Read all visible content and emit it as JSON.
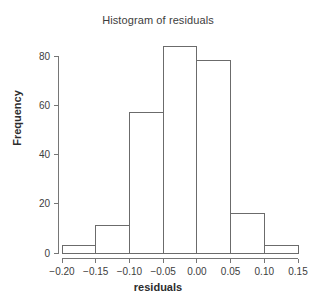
{
  "chart_data": {
    "type": "bar",
    "title": "Histogram of residuals",
    "xlabel": "residuals",
    "ylabel": "Frequency",
    "categories": [
      "-0.20 to -0.15",
      "-0.15 to -0.10",
      "-0.10 to -0.05",
      "-0.05 to 0.00",
      "0.00 to 0.05",
      "0.05 to 0.10",
      "0.10 to 0.15"
    ],
    "bin_edges": [
      -0.2,
      -0.15,
      -0.1,
      -0.05,
      0.0,
      0.05,
      0.1,
      0.15
    ],
    "values": [
      3,
      11,
      57,
      84,
      78,
      16,
      3
    ],
    "xlim": [
      -0.2,
      0.15
    ],
    "ylim": [
      0,
      84
    ],
    "x_ticks": [
      -0.2,
      -0.15,
      -0.1,
      -0.05,
      0.0,
      0.05,
      0.1,
      0.15
    ],
    "x_tick_labels": [
      "−0.20",
      "−0.15",
      "−0.10",
      "−0.05",
      "0.00",
      "0.05",
      "0.10",
      "0.15"
    ],
    "y_ticks": [
      0,
      20,
      40,
      60,
      80
    ],
    "y_tick_labels": [
      "0",
      "20",
      "40",
      "60",
      "80"
    ],
    "grid": false,
    "legend": "none",
    "bar_fill_color": "#ffffff",
    "bar_edge_color": "#6b6b6b",
    "axis_color": "#767676",
    "background_color": "#ffffff"
  }
}
